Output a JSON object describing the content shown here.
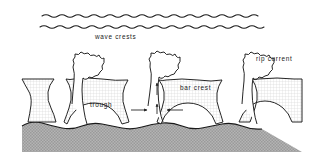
{
  "figure": {
    "background_color": "#ffffff",
    "ink_color": "#1a1a1a",
    "bar_fill_color": "#f0f0f0",
    "seabed_fill_color": "#b0b0b0",
    "water_fill_color": "#ffffff"
  },
  "labels": {
    "wave_crests": "wave crests",
    "trough": "trough",
    "bar_crest": "bar crest",
    "rip_current": "rip current"
  },
  "wave_crests": {
    "line_count": 2,
    "description": "two parallel wavy lines above the surf zone"
  },
  "rip_heads": {
    "count": 3,
    "description": "mushroom-shaped rip head plumes rising seaward"
  },
  "flow_arrows": {
    "feeder_left": "→",
    "feeder_right": "←",
    "rip_neck_up": "↑",
    "description": "longshore feeder currents converge and turn seaward through the rip neck"
  },
  "bars": {
    "count": 4,
    "description": "shore-parallel sand bars separated by rip channels"
  }
}
